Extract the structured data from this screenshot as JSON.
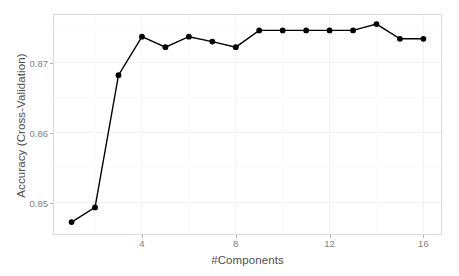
{
  "chart_data": {
    "type": "line",
    "title": "",
    "xlabel": "#Components",
    "ylabel": "Accuracy (Cross-Validation)",
    "x": [
      1,
      2,
      3,
      4,
      5,
      6,
      7,
      8,
      9,
      10,
      11,
      12,
      13,
      14,
      15,
      16
    ],
    "values": [
      0.8472,
      0.8493,
      0.8682,
      0.8737,
      0.8722,
      0.8737,
      0.873,
      0.8722,
      0.8746,
      0.8746,
      0.8746,
      0.8746,
      0.8746,
      0.8755,
      0.8734,
      0.8734
    ],
    "series": [
      {
        "name": "Accuracy (Cross-Validation)",
        "values": [
          0.8472,
          0.8493,
          0.8682,
          0.8737,
          0.8722,
          0.8737,
          0.873,
          0.8722,
          0.8746,
          0.8746,
          0.8746,
          0.8746,
          0.8746,
          0.8755,
          0.8734,
          0.8734
        ]
      }
    ],
    "xlim": [
      0.25,
      16.75
    ],
    "ylim": [
      0.8455,
      0.8768
    ],
    "xticks": [
      4,
      8,
      12,
      16
    ],
    "xtick_labels": [
      "4",
      "8",
      "12",
      "16"
    ],
    "yticks": [
      0.85,
      0.86,
      0.87
    ],
    "ytick_labels": [
      "0.85",
      "0.86",
      "0.87"
    ],
    "grid": true,
    "legend": false,
    "legend_position": "none",
    "marker": "filled-circle",
    "line_color": "#000000",
    "marker_color": "#000000",
    "panel_background": "#ffffff",
    "grid_color": "#f2f2f2",
    "panel_border_color": "#d9d9d9",
    "tick_label_color": "#808080",
    "axis_title_color": "#4d4d4d"
  }
}
